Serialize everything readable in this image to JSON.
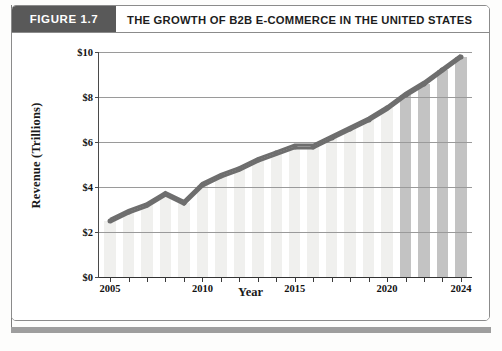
{
  "figure": {
    "tag": "FIGURE 1.7",
    "title": "THE GROWTH OF B2B E-COMMERCE IN THE UNITED STATES"
  },
  "colors": {
    "tag_background": "#595959",
    "frame_border": "#8b8b8b",
    "bar_historical": "#f0f0ee",
    "bar_projected": "#c3c3c3",
    "line": "#6e6e6e",
    "gridline": "#9a9a9a",
    "axis": "#333333",
    "footer_rule": "#9e9e9e"
  },
  "chart_data": {
    "type": "line",
    "title": "THE GROWTH OF B2B E-COMMERCE IN THE UNITED STATES",
    "xlabel": "Year",
    "ylabel": "Revenue (Trillions)",
    "xlim": [
      2004.4,
      2024.6
    ],
    "ylim": [
      0,
      10
    ],
    "grid": true,
    "legend": "none",
    "y_ticks": [
      0,
      2,
      4,
      6,
      8,
      10
    ],
    "y_tick_labels": [
      "$0",
      "$2",
      "$4",
      "$6",
      "$8",
      "$10"
    ],
    "x_ticks": [
      2005,
      2006,
      2007,
      2008,
      2009,
      2010,
      2011,
      2012,
      2013,
      2014,
      2015,
      2016,
      2017,
      2018,
      2019,
      2020,
      2021,
      2022,
      2023,
      2024
    ],
    "x_tick_labels_shown": [
      "2005",
      "2010",
      "2015",
      "2020",
      "2024"
    ],
    "categories": [
      2005,
      2006,
      2007,
      2008,
      2009,
      2010,
      2011,
      2012,
      2013,
      2014,
      2015,
      2016,
      2017,
      2018,
      2019,
      2020,
      2021,
      2022,
      2023,
      2024
    ],
    "values": [
      2.5,
      2.9,
      3.2,
      3.7,
      3.3,
      4.1,
      4.5,
      4.8,
      5.2,
      5.5,
      5.8,
      5.8,
      6.2,
      6.6,
      7.0,
      7.5,
      8.1,
      8.6,
      9.2,
      9.8
    ],
    "bar_styles": [
      "historical",
      "historical",
      "historical",
      "historical",
      "historical",
      "historical",
      "historical",
      "historical",
      "historical",
      "historical",
      "historical",
      "historical",
      "historical",
      "historical",
      "historical",
      "historical",
      "projected",
      "projected",
      "projected",
      "projected"
    ],
    "series": [
      {
        "name": "B2B E-Commerce Revenue",
        "values": [
          2.5,
          2.9,
          3.2,
          3.7,
          3.3,
          4.1,
          4.5,
          4.8,
          5.2,
          5.5,
          5.8,
          5.8,
          6.2,
          6.6,
          7.0,
          7.5,
          8.1,
          8.6,
          9.2,
          9.8
        ]
      }
    ]
  }
}
